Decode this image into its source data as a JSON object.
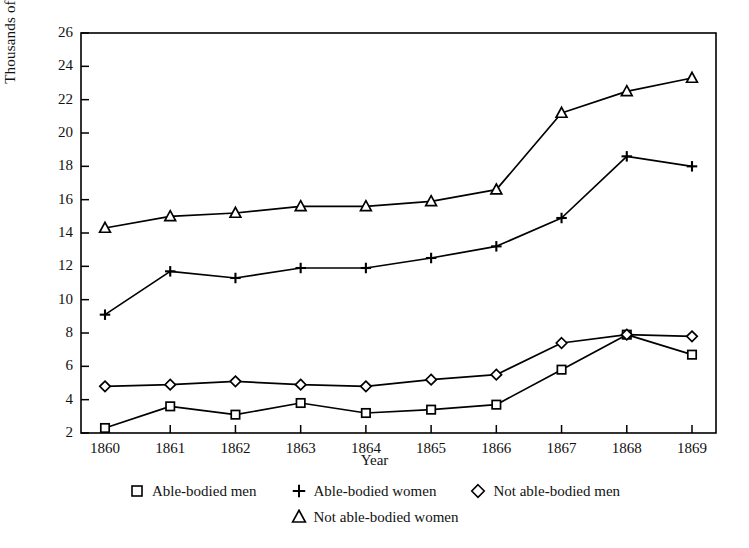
{
  "chart_data": {
    "type": "line",
    "title": "",
    "xlabel": "Year",
    "ylabel": "Thousands of paupers",
    "categories": [
      "1860",
      "1861",
      "1862",
      "1863",
      "1864",
      "1865",
      "1866",
      "1867",
      "1868",
      "1869"
    ],
    "x": [
      1860,
      1861,
      1862,
      1863,
      1864,
      1865,
      1866,
      1867,
      1868,
      1869
    ],
    "ylim": [
      2,
      26
    ],
    "ytick_labels": [
      "2",
      "4",
      "6",
      "8",
      "10",
      "12",
      "14",
      "16",
      "18",
      "20",
      "22",
      "24",
      "26"
    ],
    "yticks": [
      2,
      4,
      6,
      8,
      10,
      12,
      14,
      16,
      18,
      20,
      22,
      24,
      26
    ],
    "grid": false,
    "legend_position": "bottom",
    "series": [
      {
        "name": "Able-bodied men",
        "marker": "square",
        "values": [
          2.3,
          3.6,
          3.1,
          3.8,
          3.2,
          3.4,
          3.7,
          5.8,
          7.9,
          6.7
        ]
      },
      {
        "name": "Able-bodied women",
        "marker": "plus",
        "values": [
          9.1,
          11.7,
          11.3,
          11.9,
          11.9,
          12.5,
          13.2,
          14.9,
          18.6,
          18.0
        ]
      },
      {
        "name": "Not able-bodied men",
        "marker": "diamond",
        "values": [
          4.8,
          4.9,
          5.1,
          4.9,
          4.8,
          5.2,
          5.5,
          7.4,
          7.9,
          7.8
        ]
      },
      {
        "name": "Not able-bodied women",
        "marker": "triangle",
        "values": [
          14.3,
          15.0,
          15.2,
          15.6,
          15.6,
          15.9,
          16.6,
          21.2,
          22.5,
          23.3
        ]
      }
    ],
    "colors": {
      "line": "#000000",
      "axis": "#000000",
      "background": "#ffffff"
    }
  },
  "legend": {
    "row1": [
      "Able-bodied men",
      "Able-bodied women",
      "Not able-bodied men"
    ],
    "row2": [
      "Not able-bodied women"
    ]
  }
}
